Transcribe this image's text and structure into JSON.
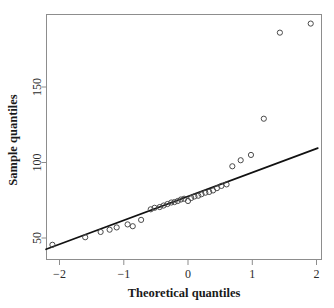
{
  "chart_data": {
    "type": "scatter",
    "title": "",
    "xlabel": "Theoretical quantiles",
    "ylabel": "Sample quantiles",
    "xlim": [
      -2.35,
      2.1
    ],
    "ylim": [
      38,
      196
    ],
    "grid": false,
    "legend": null,
    "x_ticks": [
      -2,
      -1,
      0,
      1,
      2
    ],
    "x_tick_labels": [
      "−2",
      "−1",
      "0",
      "1",
      "2"
    ],
    "y_ticks": [
      50,
      100,
      150
    ],
    "y_tick_labels": [
      "50",
      "100",
      "150"
    ],
    "series": [
      {
        "name": "Sample quantiles",
        "marker": "open-circle",
        "x": [
          -2.11,
          -1.6,
          -1.36,
          -1.22,
          -1.11,
          -0.94,
          -0.86,
          -0.73,
          -0.58,
          -0.52,
          -0.44,
          -0.38,
          -0.32,
          -0.26,
          -0.21,
          -0.16,
          -0.11,
          -0.06,
          0.0,
          0.05,
          0.1,
          0.16,
          0.21,
          0.27,
          0.33,
          0.39,
          0.45,
          0.52,
          0.6,
          0.69,
          0.82,
          0.98,
          1.18,
          1.43,
          1.91
        ],
        "y": [
          45.5,
          50.5,
          54.0,
          55.5,
          57.0,
          59.0,
          57.8,
          62.0,
          69.0,
          70.0,
          70.5,
          71.5,
          72.5,
          73.5,
          73.8,
          74.5,
          75.5,
          76.0,
          74.5,
          76.5,
          77.5,
          78.0,
          79.0,
          80.0,
          80.5,
          81.5,
          83.0,
          84.5,
          85.5,
          97.5,
          101.5,
          105.0,
          129.0,
          186.0,
          192.0
        ]
      }
    ],
    "reference_line": {
      "name": "qq-reference-line",
      "x": [
        -2.21,
        2.02
      ],
      "y": [
        42.5,
        109.5
      ]
    }
  },
  "axes": {
    "x_axis_label": "Theoretical quantiles",
    "y_axis_label": "Sample quantiles"
  },
  "colors": {
    "point_stroke": "#4a4a4a",
    "line": "#111111",
    "axis": "#8d8d8d",
    "text": "#1a1a1a",
    "background": "#ffffff"
  }
}
